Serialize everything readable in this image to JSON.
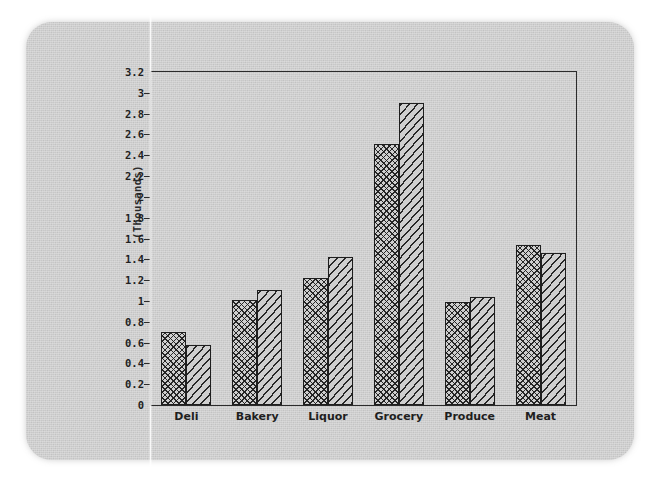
{
  "figure": {
    "y_axis_label": "(Thousands)",
    "background_color": "#cfcfcf",
    "ink_color": "#1e1e1e"
  },
  "chart_data": {
    "type": "bar",
    "title": "",
    "subtitle": "",
    "xlabel": "",
    "ylabel": "(Thousands)",
    "ylim": [
      0,
      3.2
    ],
    "ytick_step": 0.2,
    "ytick_labels": [
      "3.2",
      "3",
      "2.8",
      "2.6",
      "2.4",
      "2.2",
      "2",
      "1.8",
      "1.6",
      "1.4",
      "1.2",
      "1",
      "0.8",
      "0.6",
      "0.4",
      "0.2",
      "0"
    ],
    "ytick_values": [
      3.2,
      3.0,
      2.8,
      2.6,
      2.4,
      2.2,
      2.0,
      1.8,
      1.6,
      1.4,
      1.2,
      1.0,
      0.8,
      0.6,
      0.4,
      0.2,
      0
    ],
    "grid": false,
    "legend": false,
    "legend_position": "none",
    "categories": [
      "Deli",
      "Bakery",
      "Liquor",
      "Grocery",
      "Produce",
      "Meat"
    ],
    "series": [
      {
        "name": "Series 1",
        "pattern": "cross-hatch",
        "values": [
          0.7,
          1.01,
          1.22,
          2.51,
          0.99,
          1.54
        ]
      },
      {
        "name": "Series 2",
        "pattern": "diagonal-lines",
        "values": [
          0.58,
          1.11,
          1.42,
          2.9,
          1.04,
          1.46
        ]
      }
    ],
    "annotations": []
  }
}
